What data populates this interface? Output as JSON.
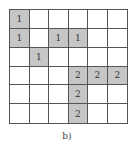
{
  "figure": {
    "caption": "b)",
    "rows": 6,
    "cols": 6,
    "shade_color": "#c6c6c6",
    "cells": [
      [
        {
          "v": "1",
          "s": true
        },
        {
          "v": "",
          "s": false
        },
        {
          "v": "",
          "s": false
        },
        {
          "v": "",
          "s": false
        },
        {
          "v": "",
          "s": false
        },
        {
          "v": "",
          "s": false
        }
      ],
      [
        {
          "v": "1",
          "s": true
        },
        {
          "v": "",
          "s": false
        },
        {
          "v": "1",
          "s": true
        },
        {
          "v": "1",
          "s": true
        },
        {
          "v": "",
          "s": false
        },
        {
          "v": "",
          "s": false
        }
      ],
      [
        {
          "v": "",
          "s": false
        },
        {
          "v": "1",
          "s": true
        },
        {
          "v": "",
          "s": false
        },
        {
          "v": "",
          "s": false
        },
        {
          "v": "",
          "s": false
        },
        {
          "v": "",
          "s": false
        }
      ],
      [
        {
          "v": "",
          "s": false
        },
        {
          "v": "",
          "s": false
        },
        {
          "v": "",
          "s": false
        },
        {
          "v": "2",
          "s": true
        },
        {
          "v": "2",
          "s": true
        },
        {
          "v": "2",
          "s": true
        }
      ],
      [
        {
          "v": "",
          "s": false
        },
        {
          "v": "",
          "s": false
        },
        {
          "v": "",
          "s": false
        },
        {
          "v": "2",
          "s": true
        },
        {
          "v": "",
          "s": false
        },
        {
          "v": "",
          "s": false
        }
      ],
      [
        {
          "v": "",
          "s": false
        },
        {
          "v": "",
          "s": false
        },
        {
          "v": "",
          "s": false
        },
        {
          "v": "2",
          "s": true
        },
        {
          "v": "",
          "s": false
        },
        {
          "v": "",
          "s": false
        }
      ]
    ]
  }
}
